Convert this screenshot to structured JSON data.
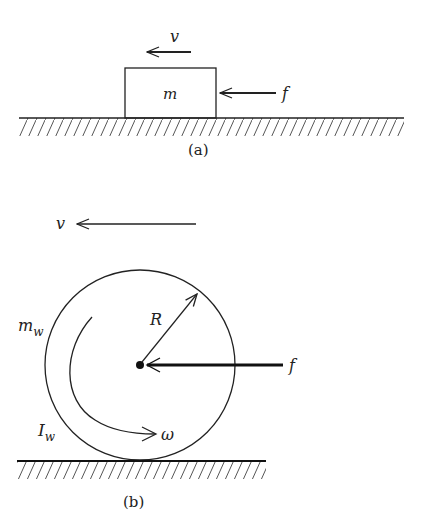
{
  "figure_a": {
    "caption": "(a)",
    "block_label": "m",
    "velocity_label": "v",
    "force_label": "f"
  },
  "figure_b": {
    "caption": "(b)",
    "velocity_label": "v",
    "mass_label": "m",
    "mass_subscript": "w",
    "inertia_label": "I",
    "inertia_subscript": "w",
    "radius_label": "R",
    "angular_velocity_label": "ω",
    "force_label": "f"
  },
  "colors": {
    "line": "#222222",
    "hatch": "#555555",
    "background": "#ffffff"
  }
}
